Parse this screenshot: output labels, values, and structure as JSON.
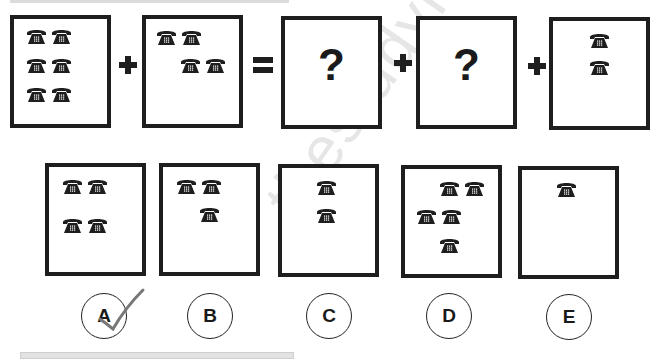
{
  "puzzle": {
    "equation": {
      "panels": [
        {
          "id": "panel-1",
          "phone_count": 6,
          "content": "phones"
        },
        {
          "id": "panel-2",
          "phone_count": 4,
          "content": "phones"
        },
        {
          "id": "panel-3",
          "content": "unknown",
          "symbol": "?"
        },
        {
          "id": "panel-4",
          "content": "unknown",
          "symbol": "?"
        },
        {
          "id": "panel-5",
          "phone_count": 2,
          "content": "phones"
        }
      ],
      "operators": [
        "+",
        "=",
        "+",
        "+"
      ]
    },
    "options": [
      {
        "label": "A",
        "phone_count": 4,
        "selected": true
      },
      {
        "label": "B",
        "phone_count": 3,
        "selected": false
      },
      {
        "label": "C",
        "phone_count": 2,
        "selected": false
      },
      {
        "label": "D",
        "phone_count": 5,
        "selected": false
      },
      {
        "label": "E",
        "phone_count": 1,
        "selected": false
      }
    ],
    "question_mark": "?",
    "icon": "telephone-icon",
    "watermark_text": "thestudymaterial",
    "colors": {
      "ink": "#1e1e1e",
      "check": "#777777",
      "watermark": "#e6e6e6"
    }
  }
}
